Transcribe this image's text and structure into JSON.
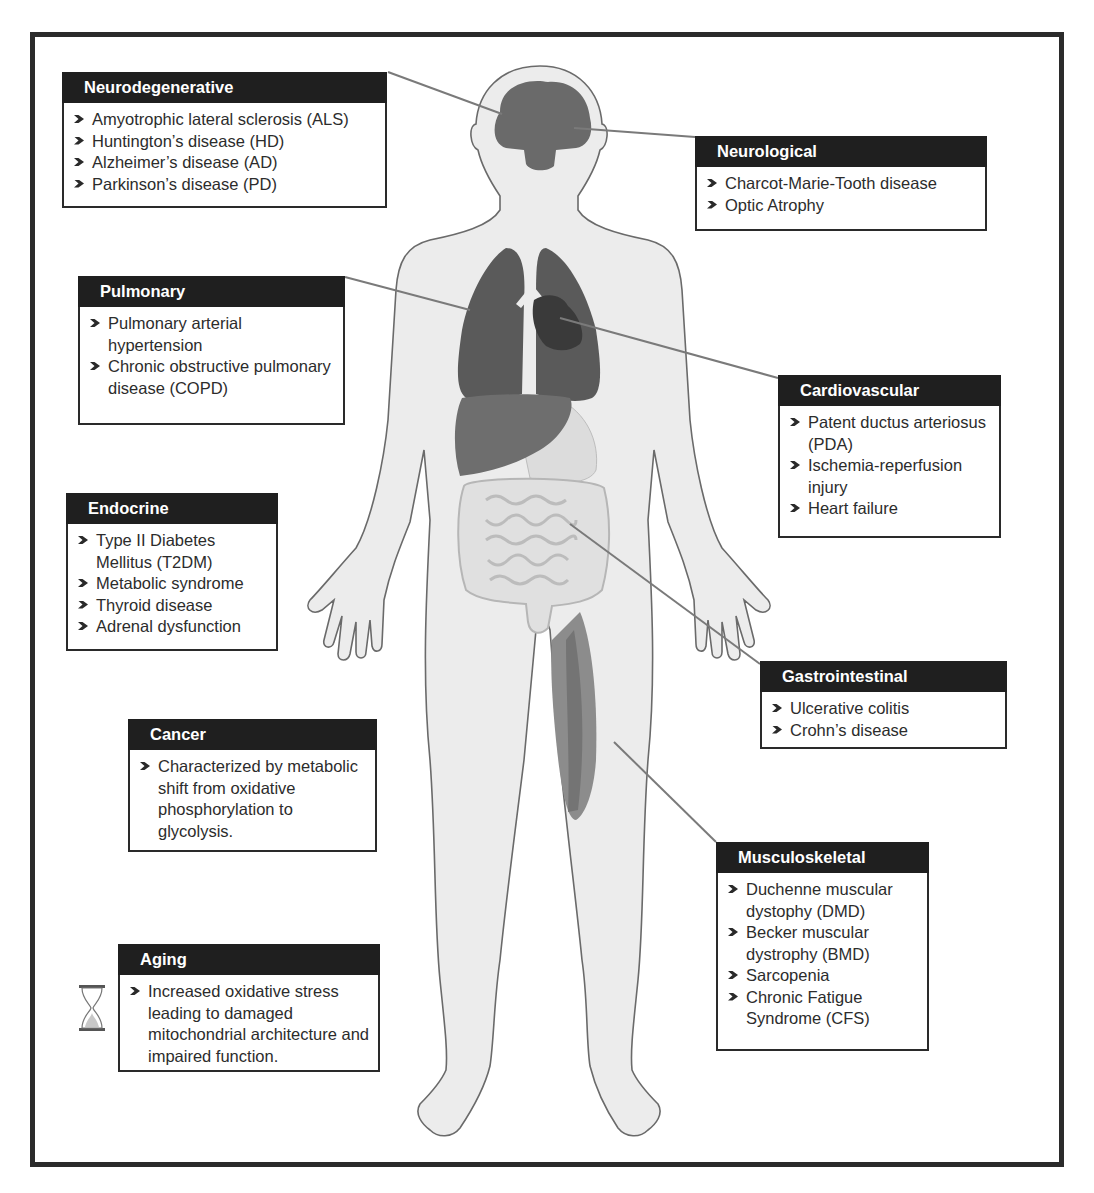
{
  "figure": {
    "colors": {
      "frame": "#2b2b2b",
      "header_bg": "#1f1f1f",
      "body_fill": "#ececec",
      "organ_dark": "#5e5e5e",
      "heart": "#3c3c3c",
      "liver": "#6e6e6e",
      "muscle": "#8a8a8a",
      "leader_line": "#7a7a7a"
    }
  },
  "categories": [
    {
      "id": "neurodegenerative",
      "title": "Neurodegenerative",
      "items": [
        "Amyotrophic lateral sclerosis (ALS)",
        "Huntington’s disease (HD)",
        "Alzheimer’s disease (AD)",
        "Parkinson’s disease (PD)"
      ]
    },
    {
      "id": "neurological",
      "title": "Neurological",
      "items": [
        "Charcot-Marie-Tooth disease",
        "Optic Atrophy"
      ]
    },
    {
      "id": "pulmonary",
      "title": "Pulmonary",
      "items": [
        "Pulmonary arterial hypertension",
        "Chronic obstructive pulmonary disease (COPD)"
      ]
    },
    {
      "id": "cardiovascular",
      "title": "Cardiovascular",
      "items": [
        "Patent ductus arteriosus (PDA)",
        "Ischemia-reperfusion injury",
        "Heart failure"
      ]
    },
    {
      "id": "endocrine",
      "title": "Endocrine",
      "items": [
        "Type II Diabetes Mellitus (T2DM)",
        "Metabolic syndrome",
        "Thyroid disease",
        "Adrenal dysfunction"
      ]
    },
    {
      "id": "gastrointestinal",
      "title": "Gastrointestinal",
      "items": [
        "Ulcerative colitis",
        "Crohn’s disease"
      ]
    },
    {
      "id": "cancer",
      "title": "Cancer",
      "items": [
        "Characterized by metabolic shift from oxidative phosphorylation to glycolysis."
      ]
    },
    {
      "id": "musculoskeletal",
      "title": "Musculoskeletal",
      "items": [
        "Duchenne muscular dystophy (DMD)",
        "Becker muscular dystrophy (BMD)",
        "Sarcopenia",
        "Chronic Fatigue Syndrome (CFS)"
      ]
    },
    {
      "id": "aging",
      "title": "Aging",
      "icon": "hourglass-icon",
      "items": [
        "Increased oxidative stress leading to damaged mitochondrial architecture and impaired function."
      ]
    }
  ]
}
